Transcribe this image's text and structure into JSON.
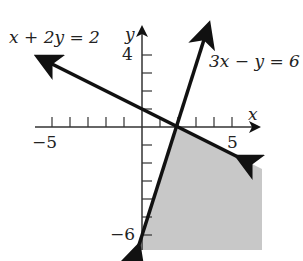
{
  "graph": {
    "line1_label": "x + 2y = 2",
    "line2_label": "3x − y = 6",
    "x_axis_label": "x",
    "y_axis_label": "y",
    "tick_labels": {
      "x_neg": "−5",
      "x_pos": "5",
      "y_pos": "4",
      "y_neg": "−6"
    },
    "shade_color": "#c8c8c8",
    "line_color": "#111111"
  }
}
